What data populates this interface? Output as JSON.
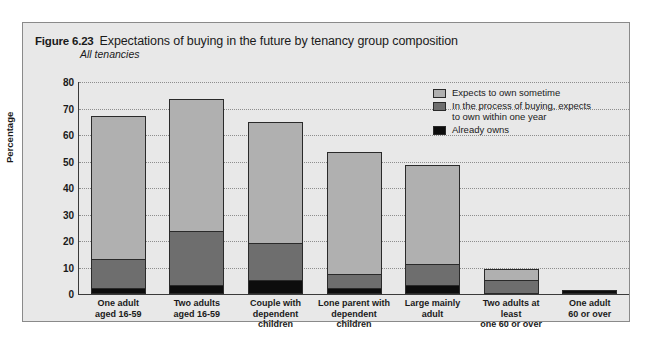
{
  "figure": {
    "number": "Figure 6.23",
    "title": "Expectations of buying in the future by tenancy group composition",
    "subtitle": "All tenancies"
  },
  "colors": {
    "expects_to_own_sometime": "#b0b0b0",
    "in_process_of_buying": "#6e6e6e",
    "already_owns": "#0d0d0d",
    "panel_background": "#e8e8e8",
    "panel_border": "#8a8a8a",
    "gridline": "#8d8d8d",
    "axis": "#3a3a3a"
  },
  "legend": {
    "position": "inside-top-right",
    "entries": [
      {
        "label": "Expects to own sometime",
        "label_line2": "",
        "swatch": "sw-light"
      },
      {
        "label": "In the process of buying, expects",
        "label_line2": "to own within one year",
        "swatch": "sw-mid"
      },
      {
        "label": "Already owns",
        "label_line2": "",
        "swatch": "sw-dark"
      }
    ]
  },
  "chart_data": {
    "type": "bar",
    "subtype": "stacked-vertical",
    "title": "Expectations of buying in the future by tenancy group composition",
    "subtitle": "All tenancies",
    "xlabel": "",
    "ylabel": "Percentage",
    "ylim": [
      0,
      80
    ],
    "yticks": [
      0,
      10,
      20,
      30,
      40,
      50,
      60,
      70,
      80
    ],
    "grid": true,
    "grid_axis": "y",
    "legend_position": "inside-top-right",
    "categories": [
      "One adult\naged 16-59",
      "Two adults\naged 16-59",
      "Couple with\ndependent children",
      "Lone parent with\ndependent children",
      "Large mainly\nadult",
      "Two adults at least\none 60 or over",
      "One adult\n60 or over"
    ],
    "category_lines": [
      [
        "One adult",
        "aged 16-59"
      ],
      [
        "Two adults",
        "aged 16-59"
      ],
      [
        "Couple with",
        "dependent children"
      ],
      [
        "Lone parent with",
        "dependent children"
      ],
      [
        "Large mainly",
        "adult"
      ],
      [
        "Two adults at least",
        "one 60 or over"
      ],
      [
        "One adult",
        "60 or over"
      ]
    ],
    "series": [
      {
        "name": "Already owns",
        "values": [
          2,
          3,
          5,
          2,
          3,
          0,
          1
        ]
      },
      {
        "name": "In the process of buying, expects to own within one year",
        "values": [
          11,
          20.5,
          14,
          5,
          8,
          5,
          0.5
        ]
      },
      {
        "name": "Expects to own sometime",
        "values": [
          54,
          50,
          46,
          46.5,
          37.5,
          4.5,
          0
        ]
      }
    ],
    "totals": [
      67,
      73.5,
      65,
      53.5,
      48.5,
      9.5,
      1.5
    ]
  }
}
